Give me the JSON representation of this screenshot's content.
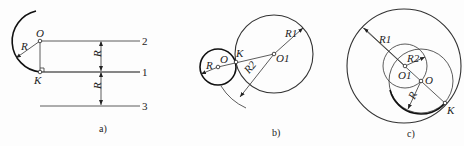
{
  "figure": {
    "panels": [
      {
        "id": "a",
        "caption": "a)",
        "labels": {
          "center": "O",
          "tangent_point": "K",
          "radius": "R",
          "dim_upper": "R",
          "dim_lower": "R"
        },
        "lines": [
          {
            "number": "2",
            "role": "offset line above"
          },
          {
            "number": "1",
            "role": "given line"
          },
          {
            "number": "3",
            "role": "offset line below"
          }
        ]
      },
      {
        "id": "b",
        "caption": "b)",
        "labels": {
          "center": "O",
          "tangent_point": "K",
          "given_center": "O1",
          "radius": "R",
          "radius_given": "R1",
          "radius_sum": "R2"
        }
      },
      {
        "id": "c",
        "caption": "c)",
        "labels": {
          "center": "O",
          "tangent_point": "K",
          "given_center": "O1",
          "radius": "R",
          "radius_given": "R1",
          "radius_diff": "R2"
        }
      }
    ],
    "colors": {
      "line": "#222222",
      "background": "#fdfdfd"
    }
  }
}
